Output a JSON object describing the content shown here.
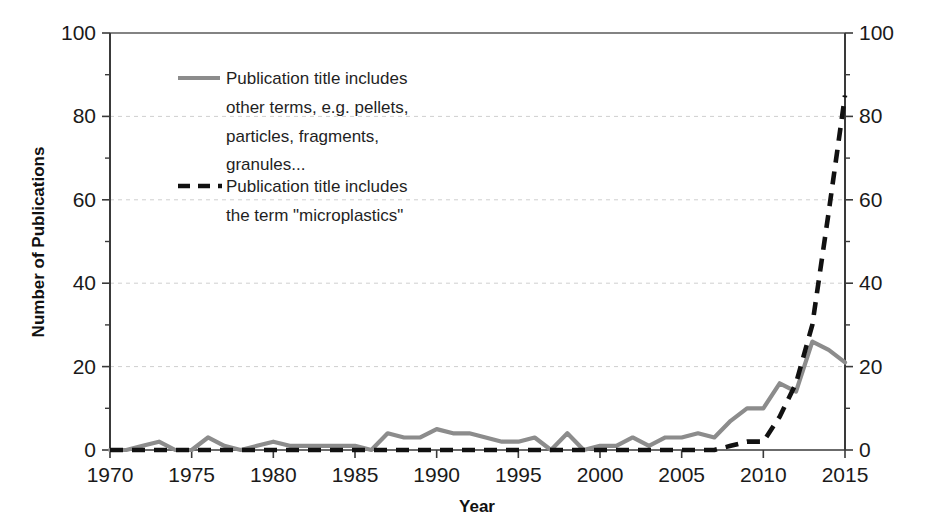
{
  "chart_data": {
    "type": "line",
    "title": "",
    "xlabel": "Year",
    "ylabel": "Number of Publications",
    "xlim": [
      1970,
      2015
    ],
    "ylim": [
      0,
      100
    ],
    "grid": "horizontal-dashed",
    "legend_position": "inside-top-left",
    "y_ticks": [
      0,
      20,
      40,
      60,
      80,
      100
    ],
    "y_tick_labels": [
      "0",
      "20",
      "40",
      "60",
      "80",
      "100"
    ],
    "y_minor_ticks": [
      10,
      30,
      50,
      70,
      90
    ],
    "x_ticks": [
      1970,
      1975,
      1980,
      1985,
      1990,
      1995,
      2000,
      2005,
      2010,
      2015
    ],
    "x_tick_labels": [
      "1970",
      "1975",
      "1980",
      "1985",
      "1990",
      "1995",
      "2000",
      "2005",
      "2010",
      "2015"
    ],
    "secondary_y_axis": {
      "ticks": [
        0,
        20,
        40,
        60,
        80,
        100
      ],
      "tick_labels": [
        "0",
        "20",
        "40",
        "60",
        "80",
        "100"
      ]
    },
    "x": [
      1970,
      1971,
      1972,
      1973,
      1974,
      1975,
      1976,
      1977,
      1978,
      1979,
      1980,
      1981,
      1982,
      1983,
      1984,
      1985,
      1986,
      1987,
      1988,
      1989,
      1990,
      1991,
      1992,
      1993,
      1994,
      1995,
      1996,
      1997,
      1998,
      1999,
      2000,
      2001,
      2002,
      2003,
      2004,
      2005,
      2006,
      2007,
      2008,
      2009,
      2010,
      2011,
      2012,
      2013,
      2014,
      2015
    ],
    "series": [
      {
        "name": "Publication title includes other terms, e.g. pellets, particles, fragments, granules...",
        "style": "solid",
        "color": "#8c8c8c",
        "values": [
          0,
          0,
          1,
          2,
          0,
          0,
          3,
          1,
          0,
          1,
          2,
          1,
          1,
          1,
          1,
          1,
          0,
          4,
          3,
          3,
          5,
          4,
          4,
          3,
          2,
          2,
          3,
          0,
          4,
          0,
          1,
          1,
          3,
          1,
          3,
          3,
          4,
          3,
          7,
          10,
          10,
          16,
          14,
          26,
          24,
          21
        ]
      },
      {
        "name": "Publication title includes the term \"microplastics\"",
        "style": "dashed",
        "color": "#111111",
        "values": [
          0,
          0,
          0,
          0,
          0,
          0,
          0,
          0,
          0,
          0,
          0,
          0,
          0,
          0,
          0,
          0,
          0,
          0,
          0,
          0,
          0,
          0,
          0,
          0,
          0,
          0,
          0,
          0,
          0,
          0,
          0,
          0,
          0,
          0,
          0,
          0,
          0,
          0,
          1,
          2,
          2,
          8,
          16,
          30,
          57,
          85
        ]
      }
    ]
  },
  "legend": {
    "items": [
      {
        "marker": "solid-line-marker",
        "lines": [
          "Publication title includes",
          "other terms, e.g. pellets,",
          "particles, fragments,",
          "granules..."
        ]
      },
      {
        "marker": "dashed-line-marker",
        "lines": [
          "Publication title includes",
          "the term \"microplastics\""
        ]
      }
    ]
  },
  "axes": {
    "y_title": "Number of Publications",
    "x_title": "Year"
  },
  "colors": {
    "series_gray": "#8c8c8c",
    "series_black": "#111111",
    "gridline": "#cfcfcf",
    "axis": "#3a3a3a",
    "text": "#1a1a1a",
    "background": "#ffffff"
  }
}
